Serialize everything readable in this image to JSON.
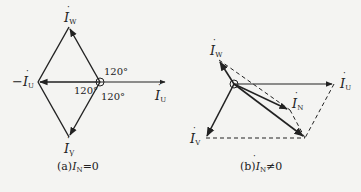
{
  "figure": {
    "panels": [
      {
        "id": "a",
        "caption_prefix": "(a)",
        "caption_var": "I",
        "caption_sub": "N",
        "caption_rel": "=0",
        "vectors": [
          {
            "name": "I",
            "sub": "U",
            "label": "İU"
          },
          {
            "name": "I",
            "sub": "V",
            "label": "İV"
          },
          {
            "name": "I",
            "sub": "W",
            "label": "İW"
          },
          {
            "name": "-I",
            "sub": "U",
            "label": "−İU"
          }
        ],
        "angles": [
          "120°",
          "120°",
          "120°"
        ]
      },
      {
        "id": "b",
        "caption_prefix": "(b)",
        "caption_var": "I",
        "caption_sub": "N",
        "caption_rel": "≠0",
        "vectors": [
          {
            "name": "I",
            "sub": "W",
            "label": "İW"
          },
          {
            "name": "I",
            "sub": "U",
            "label": "İU"
          },
          {
            "name": "I",
            "sub": "N",
            "label": "İN"
          },
          {
            "name": "I",
            "sub": "V",
            "label": "İV"
          }
        ]
      }
    ],
    "labels": {
      "a_iw": "I",
      "a_iw_sub": "W",
      "a_iu": "I",
      "a_iu_sub": "U",
      "a_neg_iu": "−I",
      "a_neg_iu_sub": "U",
      "a_iv": "I",
      "a_iv_sub": "V",
      "a_ang1": "120°",
      "a_ang2": "120°",
      "a_ang3": "120°",
      "b_iw": "I",
      "b_iw_sub": "W",
      "b_iu": "I",
      "b_iu_sub": "U",
      "b_in": "I",
      "b_in_sub": "N",
      "b_iv": "I",
      "b_iv_sub": "V"
    },
    "colors": {
      "ink": "#222222",
      "background": "#f4f4f2"
    }
  }
}
